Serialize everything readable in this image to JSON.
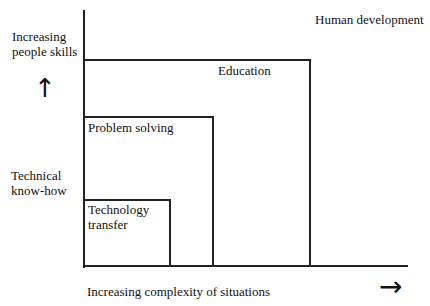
{
  "diagram": {
    "title": "Human development",
    "y_axis": {
      "top_label_line1": "Increasing",
      "top_label_line2": "people skills",
      "arrow": "↑",
      "bottom_label_line1": "Technical",
      "bottom_label_line2": "know-how"
    },
    "x_axis": {
      "label": "Increasing complexity of situations",
      "arrow": "→"
    },
    "boxes": [
      {
        "label": "Education"
      },
      {
        "label": "Problem solving"
      },
      {
        "label_line1": "Technology",
        "label_line2": "transfer"
      }
    ]
  }
}
